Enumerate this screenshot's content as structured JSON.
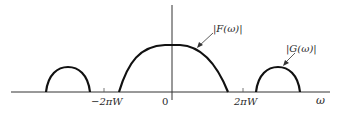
{
  "diagram": {
    "type": "frequency-spectrum",
    "axis": {
      "x_label": "ω",
      "origin_label": "0",
      "ticks": [
        {
          "label": "−2πW",
          "position": "negative"
        },
        {
          "label": "2πW",
          "position": "positive"
        }
      ]
    },
    "curves": [
      {
        "id": "F",
        "label": "|F(ω)|",
        "description": "central lobe spanning −2πW to 2πW"
      },
      {
        "id": "G",
        "label": "|G(ω)|",
        "description": "side lobe beyond 2πW"
      },
      {
        "id": "G-mirror",
        "label": "",
        "description": "side lobe beyond −2πW"
      }
    ],
    "colors": {
      "curve": "#111111",
      "axis": "#333333",
      "text": "#2a2a2a"
    }
  }
}
